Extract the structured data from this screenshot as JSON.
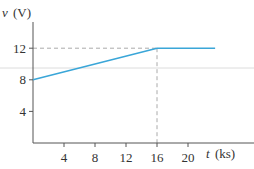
{
  "chart_data": {
    "type": "line",
    "title": "",
    "xlabel": "t (ks)",
    "ylabel": "v (V)",
    "xlabel_var": "t",
    "xlabel_unit": "(ks)",
    "ylabel_var": "v",
    "ylabel_unit": "(V)",
    "x_ticks": [
      4,
      8,
      12,
      16,
      20
    ],
    "y_ticks": [
      4,
      8,
      12
    ],
    "xlim": [
      0,
      24
    ],
    "ylim": [
      0,
      14
    ],
    "grid": false,
    "series": [
      {
        "name": "v(t)",
        "color": "#3aa6d8",
        "x": [
          0,
          16,
          23.5
        ],
        "y": [
          8,
          12,
          12
        ]
      }
    ],
    "annotations": [
      {
        "type": "dashed-hline",
        "y": 12,
        "x_from": 0,
        "x_to": 16
      },
      {
        "type": "dashed-vline",
        "x": 16,
        "y_from": 0,
        "y_to": 12
      }
    ]
  },
  "colors": {
    "line": "#3aa6d8",
    "axis": "#555555",
    "dash": "#aaaaaa"
  }
}
